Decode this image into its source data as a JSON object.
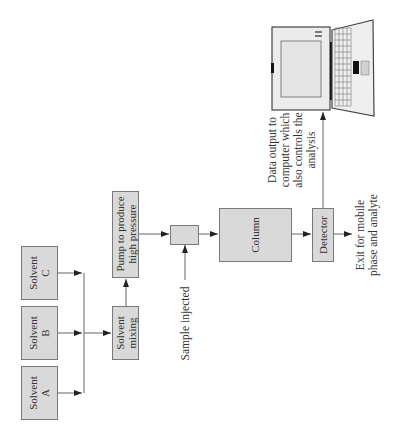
{
  "diagram": {
    "orientation": "rotated 90° counter-clockwise",
    "nodes": {
      "solvent_a": {
        "line1": "Solvent",
        "line2": "A"
      },
      "solvent_b": {
        "line1": "Solvent",
        "line2": "B"
      },
      "solvent_c": {
        "line1": "Solvent",
        "line2": "C"
      },
      "mixing": {
        "line1": "Solvent",
        "line2": "mixing"
      },
      "pump": {
        "line1": "Pump to produce",
        "line2": "high pressure"
      },
      "injector": {
        "label": ""
      },
      "column": {
        "label": "Column"
      },
      "detector": {
        "label": "Detector"
      },
      "computer": {
        "icon": "laptop-icon"
      }
    },
    "annotations": {
      "sample_injected": "Sample injected",
      "data_output": {
        "line1": "Data output to",
        "line2": "computer which",
        "line3": "also controls the",
        "line4": "analysis"
      },
      "exit": {
        "line1": "Exit for mobile",
        "line2": "phase and analyte"
      }
    },
    "edges": [
      [
        "Solvent A",
        "Solvent mixing"
      ],
      [
        "Solvent B",
        "Solvent mixing"
      ],
      [
        "Solvent C",
        "Solvent mixing"
      ],
      [
        "Solvent mixing",
        "Pump to produce high pressure"
      ],
      [
        "Pump to produce high pressure",
        "Injector"
      ],
      [
        "Sample injected",
        "Injector"
      ],
      [
        "Injector",
        "Column"
      ],
      [
        "Column",
        "Detector"
      ],
      [
        "Detector",
        "Computer"
      ],
      [
        "Detector",
        "Exit for mobile phase and analyte"
      ]
    ],
    "colors": {
      "box_fill": "#d9d9d9",
      "box_border": "#7a7a7a",
      "line": "#555555",
      "text": "#333333"
    }
  }
}
